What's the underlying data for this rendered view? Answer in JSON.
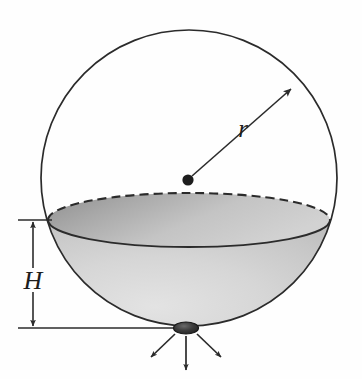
{
  "figure": {
    "background_color": "#fefefe",
    "line_color": "#2b2b2b",
    "labels": {
      "radius": "r",
      "height": "H"
    },
    "elements": {
      "sphere_outline": "sphere-outline",
      "water_surface": "water-surface-ellipse",
      "water_body": "water-body-shading",
      "center_dot": "center-point-dot",
      "radius_arrow": "radius-arrow",
      "height_dimension": "height-dimension-arrow",
      "orifice": "orifice-ellipse",
      "jet_arrows": "discharge-jet-arrows"
    },
    "colors": {
      "water_light": "#d9d9d9",
      "water_mid": "#c2c2c2",
      "surface_dark": "#9a9a9a",
      "surface_light": "#cfcfcf",
      "orifice_dark": "#2e2e2e",
      "outline": "#2b2b2b"
    },
    "geometry": {
      "sphere_center_x": 189,
      "sphere_center_y": 178,
      "sphere_radius": 148,
      "surface_ellipse_cx": 189,
      "surface_ellipse_cy": 220,
      "surface_ellipse_rx": 141,
      "surface_ellipse_ry": 27,
      "orifice_cx": 186,
      "orifice_cy": 328,
      "orifice_rx": 12,
      "orifice_ry": 6,
      "dimension_line_x": 33,
      "dimension_top_y": 220,
      "dimension_bottom_y": 328
    },
    "annotations": {
      "radius_label_x": 243,
      "radius_label_y": 133,
      "height_label_x": 33,
      "height_label_y": 283,
      "radius_arrow_from": "sphere center",
      "radius_arrow_to": "sphere surface",
      "height_measures": "free surface to orifice",
      "jet_count": 3
    }
  }
}
